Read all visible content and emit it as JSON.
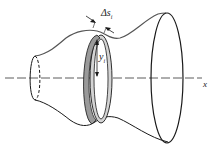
{
  "figure": {
    "labels": {
      "delta_s": "Δs",
      "delta_s_sub": "i",
      "y": "y",
      "y_sub": "i",
      "x_axis": "x"
    },
    "colors": {
      "outline": "#1a1a1a",
      "profile": "#555555",
      "band_dark": "#9a9a9a",
      "band_light": "#d4d4d4",
      "axis": "#333333"
    }
  }
}
